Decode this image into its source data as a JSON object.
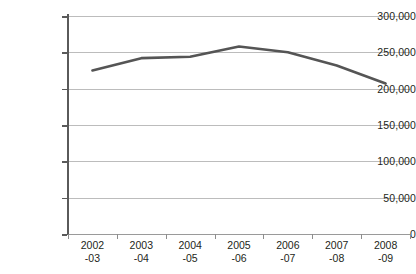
{
  "chart_data": {
    "type": "line",
    "title": "",
    "subtitle": "",
    "xlabel": "",
    "ylabel": "",
    "categories": [
      "2002-03",
      "2003-04",
      "2004-05",
      "2005-06",
      "2006-07",
      "2007-08",
      "2008-09"
    ],
    "category_lines": [
      {
        "top": "2002",
        "bottom": "-03"
      },
      {
        "top": "2003",
        "bottom": "-04"
      },
      {
        "top": "2004",
        "bottom": "-05"
      },
      {
        "top": "2005",
        "bottom": "-06"
      },
      {
        "top": "2006",
        "bottom": "-07"
      },
      {
        "top": "2007",
        "bottom": "-08"
      },
      {
        "top": "2008",
        "bottom": "-09"
      }
    ],
    "series": [
      {
        "name": "series-1",
        "color": "#555555",
        "values": [
          225000,
          242000,
          244000,
          258000,
          250000,
          232000,
          207000
        ]
      }
    ],
    "ylim": [
      0,
      300000
    ],
    "ytick_values": [
      0,
      50000,
      100000,
      150000,
      200000,
      250000,
      300000
    ],
    "ytick_labels": [
      "0",
      "50,000",
      "100,000",
      "150,000",
      "200,000",
      "250,000",
      "300,000"
    ],
    "grid": true,
    "legend": "none",
    "markers": false,
    "annotations": []
  },
  "colors": {
    "line": "#555555",
    "gridline": "#bcbcbc",
    "axis": "#5a5a5a",
    "text": "#231f20",
    "background": "#ffffff"
  }
}
